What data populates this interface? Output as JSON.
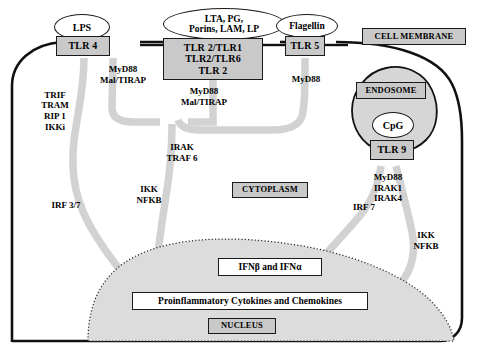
{
  "diagram": {
    "colors": {
      "ligand_fill": "#ffffff",
      "receptor_fill": "#c9c9c9",
      "membrane_stroke": "#111111",
      "arrow_fill": "#d2d2d2",
      "nucleus_fill": "#dcdcdc",
      "endosome_fill": "#d6d6d6",
      "text": "#000000"
    },
    "compartments": [
      {
        "name": "cell-membrane",
        "label": "CELL MEMBRANE",
        "style": "gray-box"
      },
      {
        "name": "cytoplasm",
        "label": "CYTOPLASM",
        "style": "gray-box"
      },
      {
        "name": "nucleus",
        "label": "NUCLEUS",
        "style": "gray-box"
      },
      {
        "name": "endosome",
        "label": "ENDOSOME",
        "style": "gray-box"
      }
    ],
    "ligands": [
      {
        "name": "lps",
        "label": "LPS",
        "binds": "TLR 4"
      },
      {
        "name": "tlr2-ligands",
        "label": "LTA, PG,\nPorins, LAM, LP",
        "binds": "TLR 2/TLR1"
      },
      {
        "name": "flagellin",
        "label": "Flagellin",
        "binds": "TLR 5"
      },
      {
        "name": "cpg",
        "label": "CpG",
        "binds": "TLR 9"
      }
    ],
    "receptors": [
      {
        "name": "tlr4",
        "label": "TLR 4"
      },
      {
        "name": "tlr2-complex",
        "label": "TLR 2/TLR1\nTLR2/TLR6\nTLR 2"
      },
      {
        "name": "tlr5",
        "label": "TLR 5"
      },
      {
        "name": "tlr9",
        "label": "TLR 9"
      }
    ],
    "adaptors": [
      {
        "name": "tlr4-myd88-adaptors",
        "label": "MyD88\nMal/TIRAP",
        "receptor": "TLR 4"
      },
      {
        "name": "tlr4-trif-adaptors",
        "label": "TRIF\nTRAM\nRIP 1\nIKKi",
        "receptor": "TLR 4"
      },
      {
        "name": "tlr2-adaptors",
        "label": "MyD88\nMal/TIRAP",
        "receptor": "TLR 2"
      },
      {
        "name": "tlr5-adaptor",
        "label": "MyD88",
        "receptor": "TLR 5"
      },
      {
        "name": "tlr9-adaptors",
        "label": "MyD88\nIRAK1\nIRAK4",
        "receptor": "TLR 9"
      }
    ],
    "signaling_nodes": [
      {
        "name": "irak-traf6",
        "label": "IRAK\nTRAF 6"
      },
      {
        "name": "irf37",
        "label": "IRF 3/7"
      },
      {
        "name": "ikk-nfkb-left",
        "label": "IKK\nNFKB"
      },
      {
        "name": "irf7",
        "label": "IRF 7"
      },
      {
        "name": "ikk-nfkb-right",
        "label": "IKK\nNFKB"
      }
    ],
    "outputs": [
      {
        "name": "interferons",
        "label": "IFNβ and IFNα"
      },
      {
        "name": "cytokines",
        "label": "Proinflammatory Cytokines  and Chemokines"
      }
    ]
  }
}
